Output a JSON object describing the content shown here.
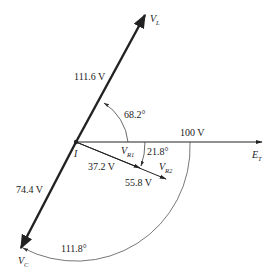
{
  "diagram": {
    "type": "phasor",
    "origin_label": "I",
    "phasors": [
      {
        "name": "V_L",
        "symbol": "V",
        "subscript": "L",
        "magnitude_label": "111.6 V",
        "angle_deg": 68.2
      },
      {
        "name": "E_T",
        "symbol": "E",
        "subscript": "T",
        "magnitude_label": "100 V",
        "angle_deg": 0
      },
      {
        "name": "V_C",
        "symbol": "V",
        "subscript": "C",
        "magnitude_label": "74.4 V",
        "angle_deg": -111.8
      },
      {
        "name": "V_R1",
        "symbol": "V",
        "subscript": "R1",
        "magnitude_label": "37.2 V",
        "angle_deg": -21.8
      },
      {
        "name": "V_R2",
        "symbol": "V",
        "subscript": "R2",
        "magnitude_label": "55.8 V",
        "angle_deg": -21.8
      }
    ],
    "angles": {
      "vl_angle": "68.2°",
      "vr_angle": "21.8°",
      "vc_angle": "111.8°"
    },
    "colors": {
      "line": "#222222",
      "arc": "#555555",
      "background": "#ffffff"
    }
  }
}
